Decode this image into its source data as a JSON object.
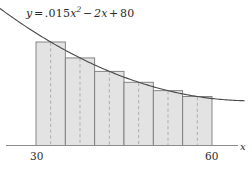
{
  "figure": {
    "title_equation": {
      "lhs": "y",
      "equals": "=",
      "coefficient": ".015",
      "var": "x",
      "exponent": "2",
      "minus": "−",
      "linear_term": "2x",
      "plus": "+",
      "constant": "80",
      "plain_text": "y = .015x² − 2x + 80"
    },
    "axis": {
      "x_label": "x",
      "ticks": [
        {
          "value": 30,
          "label": "30"
        },
        {
          "value": 60,
          "label": "60"
        }
      ]
    },
    "colors": {
      "curve": "#4a4a4a",
      "bar_fill": "#e3e3e3",
      "bar_stroke": "#7a7a7a",
      "midpoint_dash": "#a8a8a8",
      "axis": "#8d8d8d",
      "text": "#2b2b2b",
      "background": "#ffffff"
    }
  },
  "chart_data": {
    "type": "area",
    "xlabel": "x",
    "ylabel": "",
    "xlim": [
      18,
      66
    ],
    "ylim": [
      0,
      44
    ],
    "grid": false,
    "legend": "none",
    "curve": {
      "name": "y = .015x² − 2x + 80",
      "equation": "0.015*x^2 - 2*x + 80",
      "a": 0.015,
      "b": -2,
      "c": 80,
      "x_start": 18.5,
      "x_end": 65.5
    },
    "riemann_sum": {
      "method": "midpoint",
      "n": 6,
      "interval": [
        30,
        60
      ],
      "delta_x": 5,
      "bars": [
        {
          "x_left": 30,
          "x_right": 35,
          "midpoint": 32.5,
          "height": 30.84
        },
        {
          "x_left": 35,
          "x_right": 40,
          "midpoint": 37.5,
          "height": 26.09
        },
        {
          "x_left": 40,
          "x_right": 45,
          "midpoint": 42.5,
          "height": 22.09
        },
        {
          "x_left": 45,
          "x_right": 50,
          "midpoint": 47.5,
          "height": 18.84
        },
        {
          "x_left": 50,
          "x_right": 55,
          "midpoint": 52.5,
          "height": 16.34
        },
        {
          "x_left": 55,
          "x_right": 60,
          "midpoint": 57.5,
          "height": 14.59
        }
      ]
    }
  }
}
